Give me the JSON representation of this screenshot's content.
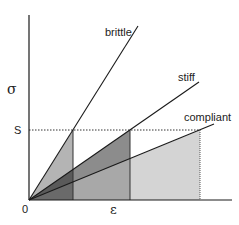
{
  "diagram": {
    "y_axis_label": "σ",
    "x_axis_label": "ε",
    "origin_label": "0",
    "stress_level_label": "S",
    "curves": [
      {
        "name": "brittle",
        "label": "brittle"
      },
      {
        "name": "stiff",
        "label": "stiff"
      },
      {
        "name": "compliant",
        "label": "compliant"
      }
    ],
    "colors": {
      "brittle_fill": "#b4b4b4",
      "stiff_fill": "#8c8c8c",
      "overlap_fill": "#6a6a6a",
      "stiff_rect_fill": "#a8a8a8",
      "compliant_fill": "#d4d4d4",
      "line": "#1a1a1a"
    }
  }
}
